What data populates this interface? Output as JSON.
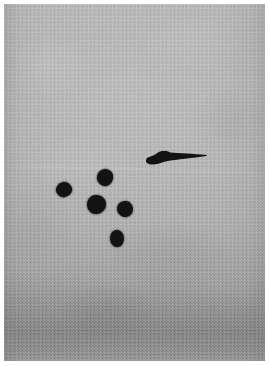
{
  "image": {
    "domain": "Natural-Image",
    "subject": "dark-specimen-marks-on-gray-sheet",
    "width": 269,
    "height": 366,
    "orientation": "portrait",
    "color_mode": "grayscale",
    "alt_text": "Grayscale photograph of a light gray textured sheet bearing five small round dark blobs clustered left of center and one elongated dark worm-shaped mark at the upper right, with a shadowed band across the bottom."
  },
  "palette": {
    "page_background": "#ffffff",
    "photo_border": "#ffffff",
    "substrate_light": "#bcbcbc",
    "substrate_mid": "#b0b0b0",
    "substrate_dark": "#9a9a9a",
    "shadow_band": "#7d7d7d",
    "specimen_ink": "#121212"
  },
  "layout": {
    "border_left": 4,
    "border_top": 4,
    "border_right": 4,
    "border_bottom": 5,
    "plate_width": 261,
    "plate_height": 357
  },
  "regions": [
    {
      "name": "upper-field",
      "label": "Upper field",
      "description": "Evenly lit pale gray expanse with fine woven texture, no specimens."
    },
    {
      "name": "specimen-field",
      "label": "Specimen field",
      "description": "Central area containing the five round blobs and the elongated mark."
    },
    {
      "name": "lower-shadow-band",
      "label": "Lower shadow band",
      "description": "Progressively darker gradient occupying the bottom quarter of the plate."
    }
  ],
  "specimens": {
    "count": 6,
    "round_count": 5,
    "elongated_count": 1,
    "round_marks": [
      {
        "id": "blob-west",
        "label": "Left round mark",
        "x": 56,
        "y": 182,
        "width": 16,
        "height": 15,
        "rotation": -14,
        "radius": "52% 48% 56% 44% / 50% 58% 42% 50%"
      },
      {
        "id": "blob-north",
        "label": "Upper round mark",
        "x": 97,
        "y": 169,
        "width": 16,
        "height": 17,
        "rotation": 12,
        "radius": "50% 50% 46% 54% / 54% 46% 52% 48%"
      },
      {
        "id": "blob-center",
        "label": "Center round mark",
        "x": 87,
        "y": 195,
        "width": 19,
        "height": 19,
        "rotation": -6,
        "radius": "48% 52% 54% 46% / 52% 48% 50% 50%"
      },
      {
        "id": "blob-east",
        "label": "Right round mark",
        "x": 117,
        "y": 201,
        "width": 16,
        "height": 16,
        "rotation": 8,
        "radius": "52% 48% 48% 52% / 48% 54% 46% 52%"
      },
      {
        "id": "blob-south",
        "label": "Lower round mark",
        "x": 110,
        "y": 230,
        "width": 14,
        "height": 17,
        "rotation": -10,
        "radius": "50% 50% 52% 48% / 56% 44% 54% 46%"
      }
    ],
    "elongated_mark": {
      "id": "worm-mark",
      "label": "Elongated worm-shaped mark",
      "x": 145,
      "y": 150,
      "width": 62,
      "height": 14,
      "rotation": -3,
      "description": "Tapered streak, thickest near its left third where a rounded bulge sits, narrowing to a fine point at the right end."
    }
  },
  "chart_data": null
}
